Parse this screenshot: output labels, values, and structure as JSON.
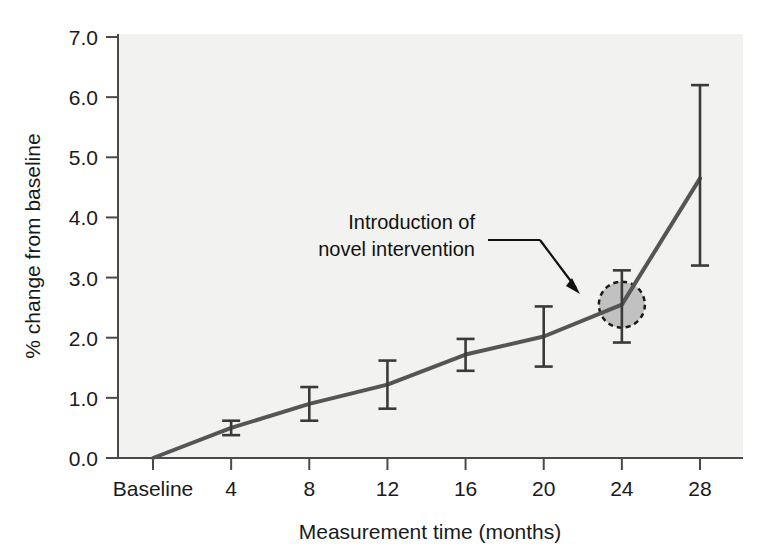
{
  "figure": {
    "background_color": "#ffffff",
    "plot_background_color": "#f2f2f0",
    "line_color": "#555555",
    "error_bar_color": "#3a3a3a",
    "circle_fill_color": "#b8b8b8",
    "circle_border_color": "#1a1a1a"
  },
  "chart_data": {
    "type": "line",
    "title": "",
    "xlabel": "Measurement time (months)",
    "ylabel": "% change from baseline",
    "categories": [
      "Baseline",
      "4",
      "8",
      "12",
      "16",
      "20",
      "24",
      "28"
    ],
    "x": [
      0,
      4,
      8,
      12,
      16,
      20,
      24,
      28
    ],
    "values": [
      0.0,
      0.5,
      0.9,
      1.22,
      1.72,
      2.02,
      2.55,
      4.65
    ],
    "error_low": [
      0.0,
      0.38,
      0.62,
      0.82,
      1.45,
      1.52,
      1.92,
      3.2
    ],
    "error_high": [
      0.0,
      0.62,
      1.18,
      1.62,
      1.98,
      2.52,
      3.12,
      6.2
    ],
    "xlim": [
      0,
      28
    ],
    "ylim": [
      0.0,
      7.0
    ],
    "ytick_labels": [
      "0.0",
      "1.0",
      "2.0",
      "3.0",
      "4.0",
      "5.0",
      "6.0",
      "7.0"
    ],
    "yticks": [
      0.0,
      1.0,
      2.0,
      3.0,
      4.0,
      5.0,
      6.0,
      7.0
    ],
    "xtick_labels": [
      "Baseline",
      "4",
      "8",
      "12",
      "16",
      "20",
      "24",
      "28"
    ],
    "grid": false,
    "legend": null,
    "markers": false,
    "error_bars": true,
    "annotations": [
      {
        "text_line_1": "Introduction of",
        "text_line_2": "novel intervention",
        "points_to_x": 24,
        "points_to_y": 2.55,
        "highlight_shape": "circle",
        "highlight_style": "dashed-outline-gray-fill"
      }
    ]
  },
  "axes": {
    "y_label": "% change from baseline",
    "x_label": "Measurement time (months)"
  }
}
